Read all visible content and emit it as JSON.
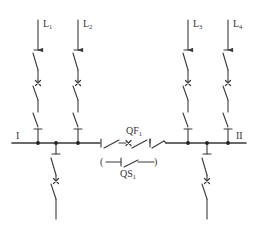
{
  "diagram": {
    "type": "single-line electrical main wiring diagram (single busbar sectionalized with bus-tie breaker)",
    "colors": {
      "line": "#3a3a3a",
      "background": "#ffffff"
    },
    "busbars": [
      {
        "id": "bus-1",
        "label": "I"
      },
      {
        "id": "bus-2",
        "label": "II"
      }
    ],
    "feeders": [
      {
        "id": "L1",
        "label": "L",
        "sub": "1",
        "bus": "I",
        "direction": "out"
      },
      {
        "id": "L2",
        "label": "L",
        "sub": "2",
        "bus": "I",
        "direction": "out"
      },
      {
        "id": "L3",
        "label": "L",
        "sub": "3",
        "bus": "II",
        "direction": "out"
      },
      {
        "id": "L4",
        "label": "L",
        "sub": "4",
        "bus": "II",
        "direction": "out"
      }
    ],
    "incoming": [
      {
        "id": "in-1",
        "bus": "I"
      },
      {
        "id": "in-2",
        "bus": "II"
      }
    ],
    "bus_tie_breaker": {
      "label": "QF",
      "sub": "1"
    },
    "bypass_disconnector": {
      "label": "QS",
      "sub": "1",
      "open_paren": "(",
      "close_paren": ")"
    }
  }
}
